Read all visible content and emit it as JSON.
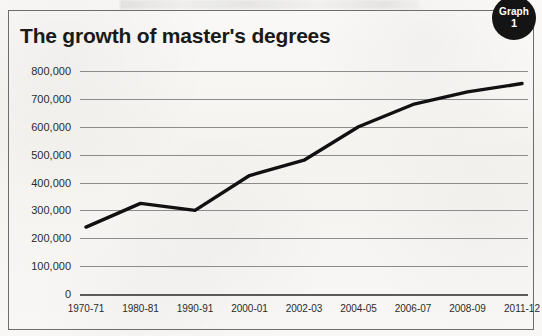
{
  "badge": {
    "word": "Graph",
    "number": "1"
  },
  "chart_data": {
    "type": "line",
    "title": "The growth of master's degrees",
    "xlabel": "",
    "ylabel": "",
    "categories": [
      "1970-71",
      "1980-81",
      "1990-91",
      "2000-01",
      "2002-03",
      "2004-05",
      "2006-07",
      "2008-09",
      "2011-12"
    ],
    "values": [
      240000,
      325000,
      300000,
      425000,
      480000,
      600000,
      680000,
      725000,
      755000
    ],
    "series": [
      {
        "name": "Master's degrees conferred",
        "values": [
          240000,
          325000,
          300000,
          425000,
          480000,
          600000,
          680000,
          725000,
          755000
        ]
      }
    ],
    "ylim": [
      0,
      800000
    ],
    "ytick_values": [
      800000,
      700000,
      600000,
      500000,
      400000,
      300000,
      200000,
      100000,
      0
    ],
    "ytick_labels": [
      "800,000",
      "700,000",
      "600,000",
      "500,000",
      "400,000",
      "300,000",
      "200,000",
      "100,000",
      "0"
    ],
    "xtick_labels": [
      "1970-71",
      "1980-81",
      "1990-91",
      "2000-01",
      "2002-03",
      "2004-05",
      "2006-07",
      "2008-09",
      "2011-12"
    ],
    "grid": true,
    "legend": "none",
    "line_color": "#111111",
    "grid_color": "#8c8c8c"
  }
}
